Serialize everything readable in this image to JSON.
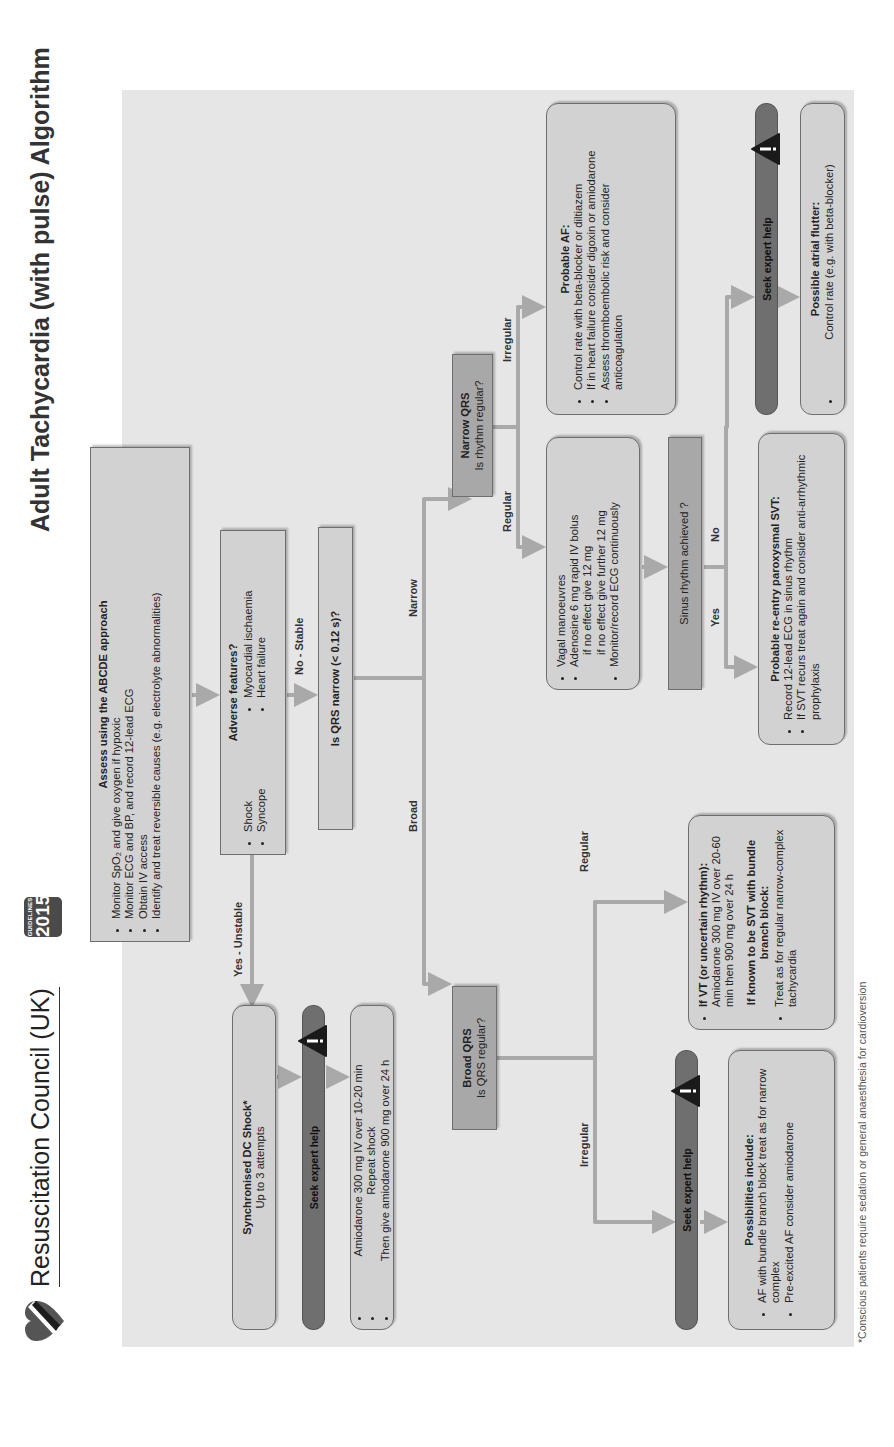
{
  "header": {
    "organisation": "Resuscitation Council (UK)",
    "badge_top": "GUIDELINES",
    "badge_year": "2015",
    "title": "Adult Tachycardia (with pulse) Algorithm"
  },
  "assess": {
    "title": "Assess using the ABCDE approach",
    "items": [
      "Monitor SpO₂ and give oxygen if hypoxic",
      "Monitor ECG and BP, and record 12-lead ECG",
      "Obtain IV access",
      "Identify and treat reversible causes (e.g. electrolyte abnormalities)"
    ]
  },
  "adverse": {
    "title": "Adverse features?",
    "items": [
      "Shock",
      "Syncope",
      "Myocardial ischaemia",
      "Heart failure"
    ]
  },
  "labels": {
    "yes_unstable": "Yes - Unstable",
    "no_stable": "No - Stable",
    "narrow": "Narrow",
    "broad": "Broad",
    "regular_narrow": "Regular",
    "irregular_narrow": "Irregular",
    "regular_broad": "Regular",
    "irregular_broad": "Irregular",
    "yes": "Yes",
    "no": "No"
  },
  "qrs_narrow_question": "Is QRS narrow (< 0.12 s)?",
  "dc_shock": {
    "title": "Synchronised DC Shock*",
    "subtitle": "Up to 3 attempts"
  },
  "seek_help": "Seek expert help",
  "amiodarone": {
    "items": [
      "Amiodarone 300 mg IV over 10-20 min",
      "Repeat shock",
      "Then give amiodarone 900 mg over 24 h"
    ]
  },
  "broad_qrs": {
    "title": "Broad QRS",
    "question": "Is QRS regular?"
  },
  "narrow_qrs": {
    "title": "Narrow QRS",
    "question": "Is rhythm regular?"
  },
  "vt": {
    "title": "If VT (or uncertain rhythm):",
    "text": "Amiodarone 300 mg IV over 20-60 min then 900 mg over 24 h",
    "svt_title": "If known to be SVT with bundle branch block:",
    "svt_text": "Treat as for regular narrow-complex tachycardia"
  },
  "possibilities": {
    "title": "Possibilities include:",
    "items": [
      "AF with bundle branch block treat as for narrow complex",
      "Pre-excited AF consider amiodarone"
    ]
  },
  "vagal": {
    "items": [
      "Vagal manoeuvres",
      "Adenosine 6 mg rapid IV bolus",
      "Monitor/record ECG continuously"
    ],
    "sub_items": [
      "if no effect give 12 mg",
      "if no effect give further 12 mg"
    ]
  },
  "sinus_question": "Sinus rhythm achieved ?",
  "reentry": {
    "title": "Probable re-entry paroxysmal SVT:",
    "items": [
      "Record 12-lead ECG in sinus rhythm",
      "If SVT recurs treat again and consider anti-arrhythmic prophylaxis"
    ]
  },
  "probable_af": {
    "title": "Probable AF:",
    "items": [
      "Control rate with beta-blocker or diltiazem",
      "If in heart failure consider digoxin or amiodarone",
      "Assess thromboembolic risk and consider anticoagulation"
    ]
  },
  "flutter": {
    "title": "Possible atrial flutter:",
    "items": [
      "Control rate (e.g. with beta-blocker)"
    ]
  },
  "footnote": "*Conscious patients require sedation or general anaesthesia for cardioversion",
  "colors": {
    "box": "#d2d2d2",
    "box_dark": "#a8a8a8",
    "help_bar": "#6f6f6f",
    "arrow": "#a9a9a9",
    "panel": "#e6e6e6"
  }
}
